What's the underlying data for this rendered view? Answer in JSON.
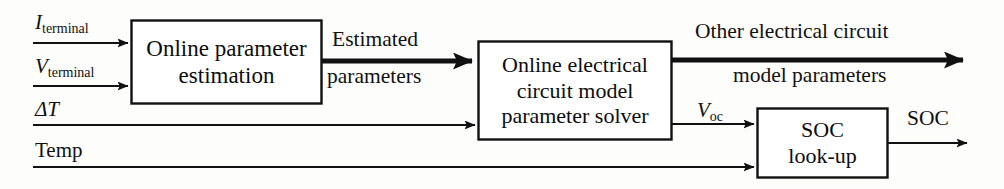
{
  "diagram": {
    "background_color": "#fdfdfb",
    "line_color": "#111111",
    "inputs": [
      {
        "id": "i-terminal",
        "symbol": "I",
        "subscript": "terminal",
        "italic_symbol": true
      },
      {
        "id": "v-terminal",
        "symbol": "V",
        "subscript": "terminal",
        "italic_symbol": true
      },
      {
        "id": "delta-t",
        "symbol": "ΔT",
        "subscript": "",
        "italic_symbol": true
      },
      {
        "id": "temp",
        "symbol": "Temp",
        "subscript": "",
        "italic_symbol": false
      }
    ],
    "blocks": [
      {
        "id": "online-parameter-estimation",
        "lines": [
          "Online parameter",
          "estimation"
        ]
      },
      {
        "id": "online-electrical-circuit-model-parameter-solver",
        "lines": [
          "Online electrical",
          "circuit model",
          "parameter solver"
        ]
      },
      {
        "id": "soc-look-up",
        "lines": [
          "SOC",
          "look-up"
        ]
      }
    ],
    "connections": [
      {
        "id": "estimated-parameters",
        "lines": [
          "Estimated",
          "parameters"
        ],
        "weight": "thick"
      },
      {
        "id": "other-electrical-circuit-model-parameters",
        "lines": [
          "Other electrical circuit",
          "model parameters"
        ],
        "weight": "thick"
      },
      {
        "id": "voc",
        "symbol": "V",
        "subscript": "oc",
        "weight": "thin"
      },
      {
        "id": "soc-output",
        "lines": [
          "SOC"
        ],
        "weight": "thin"
      }
    ]
  }
}
